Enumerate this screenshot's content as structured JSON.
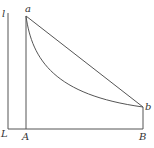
{
  "diagram": {
    "type": "geometric-curve-diagram",
    "labels": {
      "axis_top": "l",
      "origin": "L",
      "point_a": "a",
      "point_b": "b",
      "foot_a": "A",
      "foot_b": "B"
    },
    "elements": [
      {
        "name": "vertical-axis",
        "from": "L",
        "to": "l"
      },
      {
        "name": "horizontal-baseline",
        "from": "L",
        "to": "B"
      },
      {
        "name": "vertical-line-aA",
        "from": "a",
        "to": "A"
      },
      {
        "name": "vertical-line-bB",
        "from": "b",
        "to": "B"
      },
      {
        "name": "straight-chord-ab",
        "from": "a",
        "to": "b"
      },
      {
        "name": "concave-curve-ab",
        "from": "a",
        "to": "b"
      }
    ],
    "colors": {
      "line": "#555555",
      "text": "#333333",
      "background": "#ffffff"
    }
  }
}
